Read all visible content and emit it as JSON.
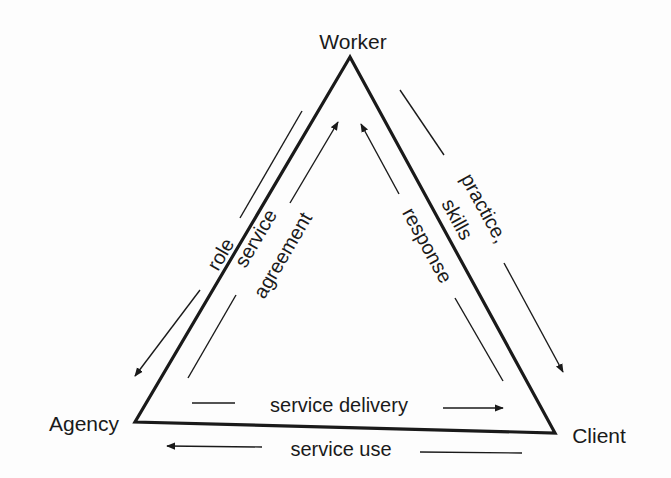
{
  "diagram": {
    "type": "triangle relationship diagram",
    "nodes": [
      {
        "id": "worker",
        "label": "Worker"
      },
      {
        "id": "agency",
        "label": "Agency"
      },
      {
        "id": "client",
        "label": "Client"
      }
    ],
    "edges": [
      {
        "id": "role",
        "from": "worker",
        "to": "agency",
        "label": "role",
        "side": "outer-left"
      },
      {
        "id": "service-agreement",
        "from": "agency",
        "to": "worker",
        "label_line1": "service",
        "label_line2": "agreement",
        "side": "inner-left"
      },
      {
        "id": "practice-skills",
        "from": "worker",
        "to": "client",
        "label_line1": "practice,",
        "label_line2": "skills",
        "side": "outer-right"
      },
      {
        "id": "response",
        "from": "client",
        "to": "worker",
        "label": "response",
        "side": "inner-right"
      },
      {
        "id": "service-delivery",
        "from": "agency",
        "to": "client",
        "label": "service delivery",
        "side": "inner-bottom"
      },
      {
        "id": "service-use",
        "from": "client",
        "to": "agency",
        "label": "service use",
        "side": "outer-bottom"
      }
    ],
    "colors": {
      "ink": "#1a1a1a",
      "background": "#fdfdfd"
    }
  }
}
